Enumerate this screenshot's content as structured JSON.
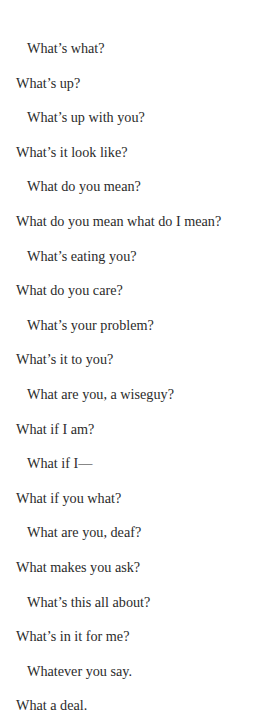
{
  "heading": {
    "text": "Abbott and Costello routine"
  },
  "dialogue": [
    {
      "speaker": "b",
      "text": "What’s what?"
    },
    {
      "speaker": "a",
      "text": "What’s up?"
    },
    {
      "speaker": "b",
      "text": "What’s up with you?"
    },
    {
      "speaker": "a",
      "text": "What’s it look like?"
    },
    {
      "speaker": "b",
      "text": "What do you mean?"
    },
    {
      "speaker": "a",
      "text": "What do you mean what do I mean?"
    },
    {
      "speaker": "b",
      "text": "What’s eating you?"
    },
    {
      "speaker": "a",
      "text": "What do you care?"
    },
    {
      "speaker": "b",
      "text": "What’s your problem?"
    },
    {
      "speaker": "a",
      "text": "What’s it to you?"
    },
    {
      "speaker": "b",
      "text": "What are you, a wiseguy?"
    },
    {
      "speaker": "a",
      "text": "What if I am?"
    },
    {
      "speaker": "b",
      "text": "What if I—"
    },
    {
      "speaker": "a",
      "text": "What if you what?"
    },
    {
      "speaker": "b",
      "text": "What are you, deaf?"
    },
    {
      "speaker": "a",
      "text": "What makes you ask?"
    },
    {
      "speaker": "b",
      "text": "What’s this all about?"
    },
    {
      "speaker": "a",
      "text": "What’s in it for me?"
    },
    {
      "speaker": "b",
      "text": "Whatever you say."
    },
    {
      "speaker": "a",
      "text": "What a deal."
    }
  ]
}
